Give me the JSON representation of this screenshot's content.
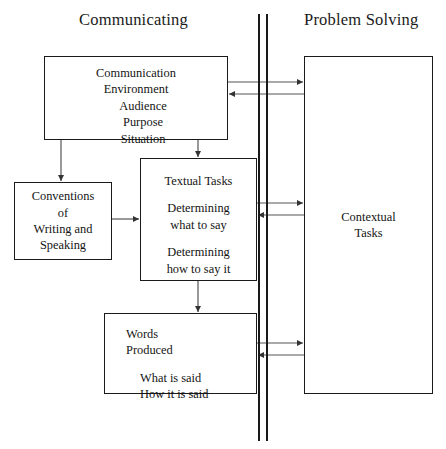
{
  "figure": {
    "columns": {
      "left_heading": "Communicating",
      "right_heading": "Problem Solving"
    },
    "boxes": {
      "communication_environment": {
        "lines": [
          "Communication",
          "Environment",
          "Audience",
          "Purpose",
          "Situation"
        ]
      },
      "conventions": {
        "lines": [
          "Conventions",
          "of",
          "Writing and",
          "Speaking"
        ]
      },
      "textual_tasks": {
        "title": "Textual Tasks",
        "group_one": [
          "Determining",
          "what to say"
        ],
        "group_two": [
          "Determining",
          "how to say it"
        ]
      },
      "words_produced": {
        "title_lines": [
          "Words",
          "Produced"
        ],
        "detail_lines": [
          "What is said",
          "How it is said"
        ]
      },
      "contextual_tasks": {
        "lines": [
          "Contextual",
          "Tasks"
        ]
      }
    },
    "caption": "",
    "colors": {
      "stroke": "#1a1a1a",
      "connector": "#555555",
      "background": "#ffffff",
      "text": "#141414"
    }
  }
}
